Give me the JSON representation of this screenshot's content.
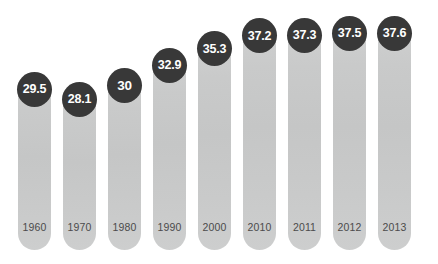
{
  "chart_data": {
    "type": "bar",
    "title": "",
    "subtitle": "",
    "xlabel": "",
    "ylabel": "",
    "categories": [
      "1960",
      "1970",
      "1980",
      "1990",
      "2000",
      "2010",
      "2011",
      "2012",
      "2013"
    ],
    "values": [
      29.5,
      28.1,
      30,
      32.9,
      35.3,
      37.2,
      37.3,
      37.5,
      37.6
    ],
    "value_labels": [
      "29.5",
      "28.1",
      "30",
      "32.9",
      "35.3",
      "37.2",
      "37.3",
      "37.5",
      "37.6"
    ],
    "series": [
      {
        "name": "",
        "values": [
          29.5,
          28.1,
          30,
          32.9,
          35.3,
          37.2,
          37.3,
          37.5,
          37.6
        ]
      }
    ],
    "ylim": [
      0,
      40
    ],
    "grid": false,
    "legend": false,
    "legend_position": "none",
    "annotations": [],
    "colors": {
      "bar": "#c8c9c9",
      "bar_top": "#cfd0d0",
      "bubble": "#383838",
      "bubble_text": "#ffffff",
      "year_text": "#4b4b4b",
      "background": "#ffffff"
    }
  },
  "bars": [
    {
      "year": "1960",
      "value_label": "29.5",
      "value": 29.5
    },
    {
      "year": "1970",
      "value_label": "28.1",
      "value": 28.1
    },
    {
      "year": "1980",
      "value_label": "30",
      "value": 30
    },
    {
      "year": "1990",
      "value_label": "32.9",
      "value": 32.9
    },
    {
      "year": "2000",
      "value_label": "35.3",
      "value": 35.3
    },
    {
      "year": "2010",
      "value_label": "37.2",
      "value": 37.2
    },
    {
      "year": "2011",
      "value_label": "37.3",
      "value": 37.3
    },
    {
      "year": "2012",
      "value_label": "37.5",
      "value": 37.5
    },
    {
      "year": "2013",
      "value_label": "37.6",
      "value": 37.6
    }
  ]
}
